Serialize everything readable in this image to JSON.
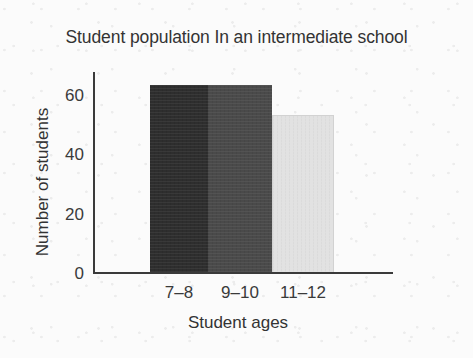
{
  "chart_data": {
    "type": "bar",
    "title": "Student population In an intermediate school",
    "xlabel": "Student ages",
    "ylabel": "Number of students",
    "categories": [
      "7–8",
      "9–10",
      "11–12"
    ],
    "values": [
      63,
      63,
      53
    ],
    "ylim": [
      0,
      68
    ],
    "yticks": [
      0,
      20,
      40,
      60
    ],
    "ytick_labels": [
      "0",
      "20",
      "40",
      "60"
    ],
    "grid": false,
    "legend": "none",
    "bar_colors": [
      "#2e2e2e",
      "#4a4a4a",
      "#e2e2e2"
    ],
    "bar_gap": 0,
    "background_color": "#fbfbfb",
    "axis_color": "#3a3a3a",
    "text_color": "#333333"
  }
}
